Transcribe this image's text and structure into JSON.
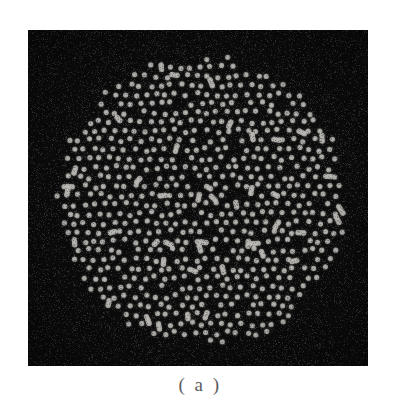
{
  "figure": {
    "caption": "( a )",
    "panel": {
      "background_color": "#111010",
      "dot_color": "#f2f0ea",
      "x": 28,
      "y": 30,
      "width": 340,
      "height": 336
    },
    "aperture": {
      "shape": "circle",
      "center_x": 174,
      "center_y": 171,
      "radius": 146
    },
    "page_background_color": "#ffffff",
    "caption_color": "#5d5d5d"
  },
  "chart_data": {
    "type": "scatter",
    "title": "( a )",
    "xlabel": "",
    "ylabel": "",
    "grid": false,
    "legend": null,
    "xlim": [
      0,
      340
    ],
    "ylim": [
      0,
      336
    ],
    "marker": {
      "shape": "circle",
      "diameter_px": 5.2,
      "color": "#f2f0ea"
    },
    "lattice": {
      "pitch_px": 10.2,
      "row_offset_px": 5.1,
      "jitter_px": 2.1,
      "merge_pair_fraction": 0.085
    },
    "point_count_estimate": 760,
    "seed": 20240517
  }
}
